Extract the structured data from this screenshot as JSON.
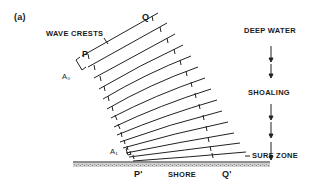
{
  "figure": {
    "panel_label": "(a)",
    "labels": {
      "wave_crests": "WAVE CRESTS",
      "deep_water": "DEEP WATER",
      "shoaling": "SHOALING",
      "surf_zone": "SURF ZONE",
      "shore": "SHORE",
      "p": "P",
      "q": "Q",
      "p_prime": "P'",
      "q_prime": "Q'",
      "a0": "A₀",
      "a1": "A₁"
    },
    "crest_count": 14,
    "colors": {
      "ink": "#1a1a1a",
      "shore_fill": "#b8b8b8",
      "background": "#ffffff"
    }
  }
}
